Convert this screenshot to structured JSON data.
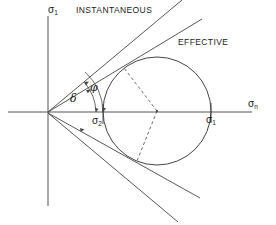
{
  "figure": {
    "type": "mohr-circle-failure-envelope",
    "background": "#ffffff",
    "line_color": "#333333",
    "text_color": "#1a1a1a",
    "width": 276,
    "height": 225
  },
  "axes": {
    "vertical_label": "σ",
    "vertical_sub": "1",
    "horizontal_label": "σ",
    "horizontal_sub": "n",
    "origin": {
      "x": 48,
      "y": 112
    },
    "vertical_top": 16,
    "vertical_bottom": 206,
    "horizontal_left": 8,
    "horizontal_right": 252
  },
  "labels": {
    "instantaneous": "INSTANTANEOUS",
    "effective": "EFFECTIVE",
    "delta": "δ",
    "phi": "φ",
    "sigma2_main": "σ",
    "sigma2_sub": "2",
    "sigma1_main": "σ",
    "sigma1_sub": "1"
  },
  "circle": {
    "center_x": 157,
    "center_y": 111,
    "radius": 54,
    "left_intercept_x": 103,
    "right_intercept_x": 211
  },
  "envelopes": [
    {
      "name": "instantaneous-upper",
      "label": "INSTANTANEOUS",
      "style": "solid"
    },
    {
      "name": "effective-upper",
      "label": "EFFECTIVE",
      "style": "solid",
      "tangent": true
    },
    {
      "name": "instantaneous-lower",
      "label": "INSTANTANEOUS",
      "style": "solid"
    },
    {
      "name": "effective-lower",
      "label": "EFFECTIVE",
      "style": "solid",
      "tangent": true
    }
  ],
  "radii": [
    {
      "name": "radius-to-upper-tangent",
      "style": "dashed"
    },
    {
      "name": "radius-to-lower-tangent",
      "style": "dashed"
    }
  ],
  "angles": [
    {
      "name": "delta-angle",
      "symbol": "δ",
      "between": "sigma-n-axis and effective envelope"
    },
    {
      "name": "phi-angle",
      "symbol": "φ",
      "between": "sigma-n-axis and instantaneous envelope"
    }
  ]
}
